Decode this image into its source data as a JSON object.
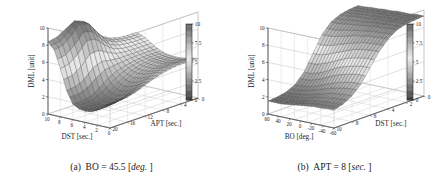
{
  "figure": {
    "background": "#ffffff",
    "panel_count": 2
  },
  "panels": [
    {
      "id": "panel-a",
      "caption_prefix": "(a)",
      "caption_body": "BO = 45.5 [",
      "caption_italic": "deg.",
      "caption_suffix": "]",
      "caption_full": "(a) BO = 45.5 [deg. ]"
    },
    {
      "id": "panel-b",
      "caption_prefix": "(b)",
      "caption_body": "APT = 8 [",
      "caption_italic": "sec.",
      "caption_suffix": "]",
      "caption_full": "(b) APT = 8 [sec. ]"
    }
  ],
  "chart_data": [
    {
      "type": "surface",
      "panel": "a",
      "title": "(a) BO = 45.5 [deg. ]",
      "zlabel": "DML [unit]",
      "xlabel": "DST [sec.]",
      "ylabel": "APT [sec.]",
      "zlim": [
        0,
        10
      ],
      "ztick_labels": [
        "0",
        "2",
        "4",
        "6",
        "8",
        "10"
      ],
      "ztick_values": [
        0,
        2,
        4,
        6,
        8,
        10
      ],
      "xlim": [
        10,
        0
      ],
      "xtick_labels": [
        "10",
        "8",
        "6",
        "4",
        "2",
        "0"
      ],
      "xtick_values": [
        10,
        8,
        6,
        4,
        2,
        0
      ],
      "ylim": [
        0,
        20
      ],
      "ytick_labels": [
        "0",
        "4",
        "8",
        "12",
        "16",
        "20"
      ],
      "ytick_values": [
        0,
        4,
        8,
        12,
        16,
        20
      ],
      "colorbar": {
        "tick_labels": [
          "0",
          "2.5",
          "5",
          "7.5",
          "10"
        ],
        "tick_values": [
          0,
          2.5,
          5,
          7.5,
          10
        ],
        "position": "right",
        "colormap": "gray-bone-inverted"
      },
      "grid": true,
      "mesh": {
        "nx": 21,
        "ny": 21
      },
      "description": "Surface high (~8-10) along the DST=10 edge with a pronounced ridge near APT=0, dropping to a broad valley (~1-3) across the mid DST range, then flattening to a plateau near DML=5-7 at large APT.",
      "z_samples": [
        [
          8.4,
          8.6,
          9.2,
          9.8,
          9.4,
          8.2,
          7.0,
          6.4,
          6.1,
          6.0,
          6.0
        ],
        [
          7.6,
          7.8,
          8.6,
          9.6,
          9.2,
          7.8,
          6.6,
          6.1,
          5.9,
          5.8,
          5.8
        ],
        [
          5.6,
          5.8,
          6.6,
          7.8,
          7.6,
          6.6,
          5.8,
          5.5,
          5.4,
          5.4,
          5.4
        ],
        [
          3.2,
          3.3,
          3.8,
          4.8,
          5.2,
          5.0,
          4.9,
          4.9,
          4.9,
          4.9,
          4.9
        ],
        [
          1.8,
          1.8,
          2.0,
          2.6,
          3.4,
          3.9,
          4.2,
          4.4,
          4.5,
          4.5,
          4.5
        ],
        [
          1.4,
          1.4,
          1.5,
          1.9,
          2.6,
          3.3,
          3.8,
          4.1,
          4.3,
          4.3,
          4.3
        ],
        [
          1.3,
          1.3,
          1.4,
          1.7,
          2.3,
          3.0,
          3.6,
          4.0,
          4.2,
          4.2,
          4.2
        ],
        [
          1.4,
          1.4,
          1.5,
          1.8,
          2.4,
          3.1,
          3.7,
          4.0,
          4.2,
          4.2,
          4.2
        ],
        [
          1.8,
          1.8,
          1.9,
          2.2,
          2.8,
          3.4,
          3.9,
          4.2,
          4.3,
          4.3,
          4.3
        ],
        [
          2.4,
          2.4,
          2.5,
          2.8,
          3.3,
          3.8,
          4.2,
          4.4,
          4.5,
          4.5,
          4.5
        ],
        [
          2.8,
          2.8,
          2.9,
          3.2,
          3.6,
          4.0,
          4.3,
          4.5,
          4.6,
          4.6,
          4.6
        ]
      ]
    },
    {
      "type": "surface",
      "panel": "b",
      "title": "(b) APT = 8 [sec. ]",
      "zlabel": "DML [unit]",
      "xlabel": "BO [deg.]",
      "ylabel": "DST [sec.]",
      "zlim": [
        0,
        10
      ],
      "ztick_labels": [
        "0",
        "2",
        "4",
        "6",
        "8",
        "10"
      ],
      "ztick_values": [
        0,
        2,
        4,
        6,
        8,
        10
      ],
      "xlim": [
        60,
        -60
      ],
      "xtick_labels": [
        "60",
        "40",
        "20",
        "0",
        "-20",
        "-40",
        "-60"
      ],
      "xtick_values": [
        60,
        40,
        20,
        0,
        -20,
        -40,
        -60
      ],
      "ylim": [
        0,
        10
      ],
      "ytick_labels": [
        "0",
        "2",
        "4",
        "6",
        "8",
        "10"
      ],
      "ytick_values": [
        0,
        2,
        4,
        6,
        8,
        10
      ],
      "colorbar": {
        "tick_labels": [
          "0",
          "2.5",
          "5",
          "7.5",
          "10"
        ],
        "tick_values": [
          0,
          2.5,
          5,
          7.5,
          10
        ],
        "position": "right",
        "colormap": "gray-bone-inverted"
      },
      "grid": true,
      "mesh": {
        "nx": 21,
        "ny": 21
      },
      "description": "Saddle-shaped surface: low plateau (~1-2) at low DST, rising steeply through a dark diagonal ridge to a high plateau (~8-9) at large DST; smooth monotone transition across BO.",
      "z_samples": [
        [
          1.5,
          1.6,
          1.8,
          2.3,
          3.4,
          5.2,
          7.0,
          8.1,
          8.6,
          8.8,
          8.9
        ],
        [
          1.5,
          1.6,
          1.8,
          2.3,
          3.4,
          5.2,
          7.0,
          8.1,
          8.6,
          8.8,
          8.9
        ],
        [
          1.5,
          1.6,
          1.9,
          2.4,
          3.6,
          5.4,
          7.1,
          8.2,
          8.7,
          8.9,
          9.0
        ],
        [
          1.6,
          1.7,
          2.0,
          2.6,
          3.9,
          5.7,
          7.3,
          8.3,
          8.8,
          9.0,
          9.0
        ],
        [
          1.7,
          1.8,
          2.2,
          2.9,
          4.3,
          6.0,
          7.5,
          8.4,
          8.8,
          9.0,
          9.1
        ],
        [
          1.8,
          2.0,
          2.4,
          3.2,
          4.7,
          6.3,
          7.7,
          8.5,
          8.9,
          9.1,
          9.1
        ],
        [
          1.9,
          2.1,
          2.6,
          3.5,
          5.0,
          6.6,
          7.8,
          8.6,
          9.0,
          9.1,
          9.2
        ],
        [
          2.0,
          2.2,
          2.8,
          3.7,
          5.2,
          6.8,
          8.0,
          8.7,
          9.0,
          9.2,
          9.2
        ],
        [
          2.0,
          2.3,
          2.9,
          3.9,
          5.4,
          6.9,
          8.0,
          8.7,
          9.1,
          9.2,
          9.2
        ],
        [
          2.1,
          2.3,
          3.0,
          4.0,
          5.5,
          7.0,
          8.1,
          8.8,
          9.1,
          9.2,
          9.3
        ],
        [
          2.1,
          2.4,
          3.0,
          4.0,
          5.5,
          7.0,
          8.1,
          8.8,
          9.1,
          9.2,
          9.3
        ]
      ]
    }
  ]
}
